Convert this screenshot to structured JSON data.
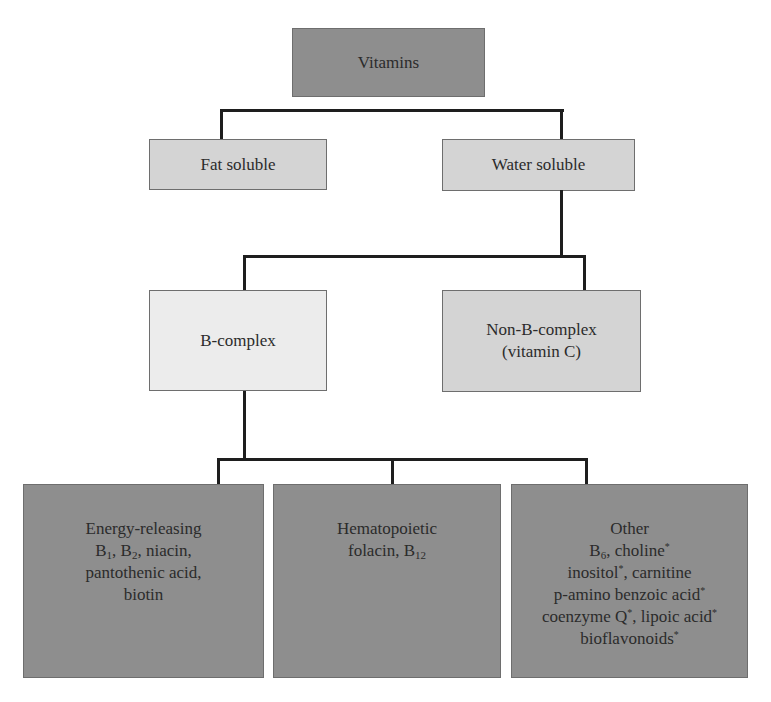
{
  "diagram": {
    "type": "hierarchy",
    "title": "Vitamins",
    "colors": {
      "dark_box": "#8e8e8e",
      "mid_box": "#d4d4d4",
      "light_box": "#ececec",
      "connector": "#1e1e1e",
      "text": "#2b2b2b"
    },
    "root": {
      "label": "Vitamins"
    },
    "level1": {
      "fat_soluble": {
        "label": "Fat soluble"
      },
      "water_soluble": {
        "label": "Water soluble"
      }
    },
    "level2": {
      "b_complex": {
        "label": "B-complex"
      },
      "non_b_complex": {
        "line1": "Non-B-complex",
        "line2": "(vitamin C)"
      }
    },
    "level3": {
      "energy_releasing": {
        "title": "Energy-releasing",
        "b1_base": "B",
        "b1_sub": "1",
        "b2_base": "B",
        "b2_sub": "2",
        "line2_sep": ", ",
        "line2_rest": ", niacin,",
        "line3": "pantothenic acid,",
        "line4": "biotin"
      },
      "hematopoietic": {
        "title": "Hematopoietic",
        "line2_text": "folacin, B",
        "line2_sub": "12"
      },
      "other": {
        "title": "Other",
        "b6_base": "B",
        "b6_sub": "6",
        "line2_rest": ", choline",
        "line3_a": "inositol",
        "line3_b": ", carnitine",
        "line4": "p-amino benzoic acid",
        "line5_a": "coenzyme Q",
        "line5_b": ", lipoic acid",
        "line6": "bioflavonoids",
        "asterisk": "*"
      }
    },
    "edges": [
      [
        "Vitamins",
        "Fat soluble"
      ],
      [
        "Vitamins",
        "Water soluble"
      ],
      [
        "Water soluble",
        "B-complex"
      ],
      [
        "Water soluble",
        "Non-B-complex (vitamin C)"
      ],
      [
        "B-complex",
        "Energy-releasing"
      ],
      [
        "B-complex",
        "Hematopoietic"
      ],
      [
        "B-complex",
        "Other"
      ]
    ]
  }
}
